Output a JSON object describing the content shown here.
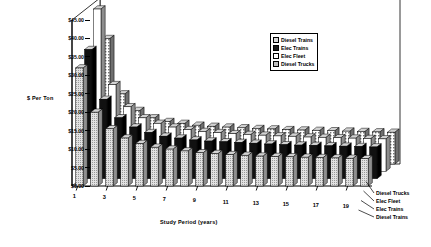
{
  "chart_data": {
    "type": "bar",
    "title": "",
    "xlabel": "Study Period (years)",
    "ylabel": "$ Per Ton",
    "ylim": [
      0,
      45
    ],
    "ytick_labels": [
      "$45.00",
      "$40.00",
      "$35.00",
      "$30.00",
      "$25.00",
      "$20.00",
      "$15.00",
      "$10.00",
      "$5.00",
      "$0.00"
    ],
    "ytick_values": [
      45,
      40,
      35,
      30,
      25,
      20,
      15,
      10,
      5,
      0
    ],
    "xtick_labels": [
      "1",
      "3",
      "5",
      "7",
      "9",
      "11",
      "13",
      "15",
      "17",
      "19"
    ],
    "categories": [
      1,
      2,
      3,
      4,
      5,
      6,
      7,
      8,
      9,
      10,
      11,
      12,
      13,
      14,
      15,
      16,
      17,
      18,
      19,
      20
    ],
    "grid": false,
    "legend_position": "top-right",
    "projection": "3d-clustered-column",
    "series": [
      {
        "name": "Diesel Trains",
        "fill": "light-grey",
        "values": [
          32.0,
          20.0,
          15.5,
          13.0,
          11.5,
          10.5,
          10.0,
          9.5,
          9.0,
          8.8,
          8.5,
          8.3,
          8.1,
          8.0,
          7.9,
          7.8,
          7.7,
          7.6,
          7.5,
          7.4
        ]
      },
      {
        "name": "Elec Trains",
        "fill": "black",
        "values": [
          35.0,
          21.5,
          16.5,
          14.0,
          12.5,
          11.5,
          11.0,
          10.5,
          10.2,
          10.0,
          9.8,
          9.6,
          9.4,
          9.2,
          9.1,
          9.0,
          8.9,
          8.8,
          8.7,
          8.6
        ]
      },
      {
        "name": "Elec Fleet",
        "fill": "white",
        "values": [
          44.0,
          23.5,
          17.5,
          14.5,
          13.0,
          12.0,
          11.3,
          10.8,
          10.5,
          10.2,
          10.0,
          9.8,
          9.6,
          9.5,
          9.3,
          9.2,
          9.1,
          9.0,
          8.9,
          8.8
        ]
      },
      {
        "name": "Diesel Trucks",
        "fill": "hatched-grey",
        "values": [
          34.0,
          19.0,
          14.5,
          12.5,
          11.5,
          11.0,
          10.5,
          10.2,
          10.0,
          9.8,
          9.6,
          9.5,
          9.3,
          9.2,
          9.1,
          9.0,
          8.9,
          8.8,
          8.7,
          8.6
        ]
      }
    ]
  },
  "legend": {
    "items": [
      {
        "label": "Diesel Trains",
        "swatch": "#d8d8d8"
      },
      {
        "label": "Elec Trains",
        "swatch": "#1a1a1a"
      },
      {
        "label": "Elec Fleet",
        "swatch": "#ffffff"
      },
      {
        "label": "Diesel Trucks",
        "swatch": "#bfbfbf"
      }
    ]
  },
  "depth_axis": {
    "items": [
      {
        "label": "Diesel Trucks"
      },
      {
        "label": "Elec Fleet"
      },
      {
        "label": "Elec Trains"
      },
      {
        "label": "Diesel Trains"
      }
    ]
  }
}
